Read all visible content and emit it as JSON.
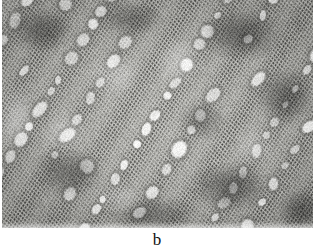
{
  "figure": {
    "panel_label": "b",
    "caption_position": "below-image",
    "image_kind": "light-micrograph",
    "colorspace": "grayscale",
    "frame": {
      "x": 2,
      "y": 0,
      "width": 311,
      "height": 228
    },
    "canvas": {
      "page_width": 318,
      "page_height": 252,
      "background": "#ffffff"
    }
  },
  "micrograph": {
    "alt_text": "Grayscale transverse micrograph showing large pale vessel pores arranged in diagonal chains embedded in dense fine-celled fibre tissue",
    "tones": {
      "background_paper": "#ffffff",
      "lumen_light": "#f6f6f4",
      "cell_wall_mid": "#8b8b88",
      "fibre_dark": "#4a4a48",
      "shadow_darkest": "#2b2b2a",
      "tissue_base": "#b9b9b5"
    },
    "structure": {
      "pore_band_angle_deg": -58,
      "pore_band_count": 9,
      "pore_band_spacing_px": 34,
      "pore_major_axis_px": 15,
      "pore_minor_axis_px": 11,
      "fibre_grid_pitch_px": 3.1,
      "vignette_strength": 0.16,
      "noise_amount": 0.12,
      "blur_px": 0.55
    },
    "dark_patches": [
      {
        "cx": 40,
        "cy": 30,
        "rx": 34,
        "ry": 26,
        "strength": 0.38
      },
      {
        "cx": 128,
        "cy": 18,
        "rx": 40,
        "ry": 22,
        "strength": 0.3
      },
      {
        "cx": 238,
        "cy": 34,
        "rx": 48,
        "ry": 30,
        "strength": 0.42
      },
      {
        "cx": 283,
        "cy": 96,
        "rx": 34,
        "ry": 34,
        "strength": 0.4
      },
      {
        "cx": 200,
        "cy": 120,
        "rx": 30,
        "ry": 24,
        "strength": 0.26
      },
      {
        "cx": 66,
        "cy": 172,
        "rx": 40,
        "ry": 30,
        "strength": 0.34
      },
      {
        "cx": 228,
        "cy": 186,
        "rx": 46,
        "ry": 28,
        "strength": 0.4
      },
      {
        "cx": 150,
        "cy": 214,
        "rx": 52,
        "ry": 22,
        "strength": 0.3
      },
      {
        "cx": 300,
        "cy": 210,
        "rx": 30,
        "ry": 26,
        "strength": 0.36
      }
    ],
    "light_patches": [
      {
        "cx": 12,
        "cy": 118,
        "rx": 22,
        "ry": 40,
        "strength": 0.3
      },
      {
        "cx": 112,
        "cy": 74,
        "rx": 30,
        "ry": 26,
        "strength": 0.22
      },
      {
        "cx": 176,
        "cy": 60,
        "rx": 26,
        "ry": 30,
        "strength": 0.24
      },
      {
        "cx": 60,
        "cy": 132,
        "rx": 26,
        "ry": 24,
        "strength": 0.22
      },
      {
        "cx": 252,
        "cy": 146,
        "rx": 24,
        "ry": 22,
        "strength": 0.2
      },
      {
        "cx": 118,
        "cy": 198,
        "rx": 26,
        "ry": 18,
        "strength": 0.2
      }
    ]
  },
  "chart_data": {
    "type": "heatmap",
    "title": "b",
    "xlabel": "",
    "ylabel": "",
    "value_range": [
      0,
      255
    ],
    "legend": []
  }
}
